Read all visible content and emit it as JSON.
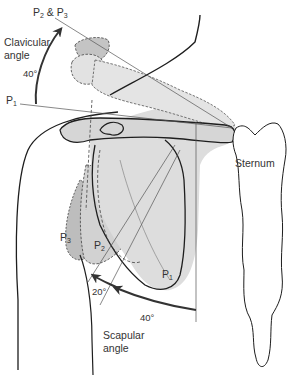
{
  "diagram": {
    "labels": {
      "p2_p3": {
        "p": "P",
        "s1": "2",
        "amp": " & P",
        "s2": "3"
      },
      "clavicular_angle": [
        "Clavicular",
        "angle"
      ],
      "clavicular_degrees": "40°",
      "p1_left": {
        "p": "P",
        "s": "1"
      },
      "sternum": "Sternum",
      "p3_scapula": {
        "p": "P",
        "s": "3"
      },
      "p2_scapula": {
        "p": "P",
        "s": "2"
      },
      "p1_scapula": {
        "p": "P",
        "s": "1"
      },
      "scapular_20": "20°",
      "scapular_40": "40°",
      "scapular_angle": [
        "Scapular",
        "angle"
      ]
    },
    "colors": {
      "fill_light": "#dcdcdc",
      "fill_mid": "#c4c4c4",
      "fill_dark": "#b0b0b0",
      "stroke": "#1e1e1e",
      "thin": "#555555",
      "text": "#333333"
    }
  }
}
